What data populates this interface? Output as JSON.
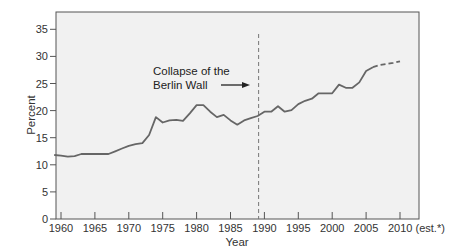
{
  "chart_data": {
    "type": "line",
    "title": "",
    "xlabel": "Year",
    "ylabel": "Percent",
    "xlim": [
      1959,
      2012
    ],
    "ylim": [
      0,
      37
    ],
    "grid": false,
    "legend": null,
    "x_ticks": [
      1960,
      1965,
      1970,
      1975,
      1980,
      1985,
      1990,
      1995,
      2000,
      2005,
      2010
    ],
    "x_tick_labels": [
      "1960",
      "1965",
      "1970",
      "1975",
      "1980",
      "1985",
      "1990",
      "1995",
      "2000",
      "2005",
      "2010 (est.*)"
    ],
    "y_ticks": [
      0,
      5,
      10,
      15,
      20,
      25,
      30,
      35
    ],
    "y_tick_labels": [
      "0",
      "5",
      "10",
      "15",
      "20",
      "25",
      "30",
      "35"
    ],
    "series": [
      {
        "name": "Actual",
        "style": "solid",
        "x": [
          1959,
          1960,
          1961,
          1962,
          1963,
          1964,
          1965,
          1966,
          1967,
          1968,
          1969,
          1970,
          1971,
          1972,
          1973,
          1974,
          1975,
          1976,
          1977,
          1978,
          1979,
          1980,
          1981,
          1982,
          1983,
          1984,
          1985,
          1986,
          1987,
          1988,
          1989,
          1990,
          1991,
          1992,
          1993,
          1994,
          1995,
          1996,
          1997,
          1998,
          1999,
          2000,
          2001,
          2002,
          2003,
          2004,
          2005,
          2006
        ],
        "values": [
          11.8,
          11.7,
          11.5,
          11.6,
          12.0,
          12.0,
          12.0,
          12.0,
          12.0,
          12.5,
          13.0,
          13.5,
          13.8,
          14.0,
          15.5,
          18.8,
          17.8,
          18.2,
          18.3,
          18.1,
          19.5,
          21.0,
          21.0,
          19.8,
          18.8,
          19.2,
          18.2,
          17.4,
          18.2,
          18.6,
          19.0,
          19.8,
          19.8,
          20.8,
          19.8,
          20.1,
          21.2,
          21.8,
          22.2,
          23.2,
          23.2,
          23.2,
          24.8,
          24.2,
          24.2,
          25.2,
          27.3,
          28.0
        ]
      },
      {
        "name": "Estimated",
        "style": "dashed",
        "x": [
          2006,
          2007,
          2008,
          2009,
          2010
        ],
        "values": [
          28.0,
          28.4,
          28.6,
          28.8,
          29.1
        ]
      }
    ],
    "annotations": [
      {
        "text": "Collapse of the Berlin Wall",
        "x": 1989,
        "type": "vertical-dashed-line-with-arrow"
      }
    ]
  },
  "annotation": {
    "line1": "Collapse of the",
    "line2": "Berlin Wall"
  },
  "colors": {
    "plot_background": "#f1f1f1",
    "frame": "#555555",
    "series_line": "#666666",
    "marker_line": "#777777",
    "text": "#333333"
  }
}
